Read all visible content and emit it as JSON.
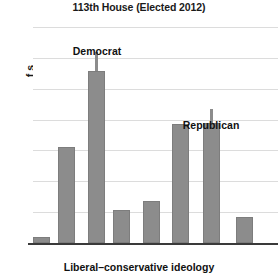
{
  "chart_data": {
    "type": "bar",
    "title": "113th House (Elected 2012)",
    "xlabel": "Liberal–conservative ideology",
    "ylabel_clipped": "f\ns",
    "ylabel_visible_fragment": "f s",
    "categories": [
      "",
      "",
      "",
      "",
      "",
      "",
      "",
      ""
    ],
    "values": [
      2.0,
      31.2,
      55.6,
      10.8,
      13.6,
      38.5,
      39.0,
      8.5
    ],
    "ylim": [
      0,
      70
    ],
    "yticks": [
      0,
      10,
      20,
      30,
      40,
      50,
      60,
      70
    ],
    "ytick_labels": [
      "0",
      "10",
      "20",
      "30",
      "40",
      "50",
      "60",
      "70"
    ],
    "xtick_labels": [
      "Liberal",
      "Moderate",
      "Conservative"
    ],
    "grid": true,
    "legend": "none",
    "bar_color": "#8c8c8c",
    "annotations": [
      {
        "text": "Democrat",
        "bar_index": 2,
        "value": 55.6,
        "error_top": 62.0
      },
      {
        "text": "Republican",
        "bar_index": 6,
        "value": 39.0,
        "error_top": 43.5
      }
    ],
    "error_bars": [
      {
        "bar_index": 2,
        "top": 62.0,
        "bottom": 55.6
      },
      {
        "bar_index": 6,
        "top": 43.5,
        "bottom": 39.0
      }
    ]
  },
  "geometry": {
    "bars_px": [
      {
        "left": 0,
        "width": 17
      },
      {
        "left": 25,
        "width": 17
      },
      {
        "left": 55,
        "width": 17
      },
      {
        "left": 80,
        "width": 17
      },
      {
        "left": 110,
        "width": 17
      },
      {
        "left": 139,
        "width": 17
      },
      {
        "left": 170,
        "width": 17
      },
      {
        "left": 203,
        "width": 17
      }
    ],
    "xtick_px": [
      16,
      128,
      232
    ],
    "annot_px": [
      {
        "left": 64,
        "top": 18
      },
      {
        "left": 178,
        "top": 92
      }
    ]
  }
}
